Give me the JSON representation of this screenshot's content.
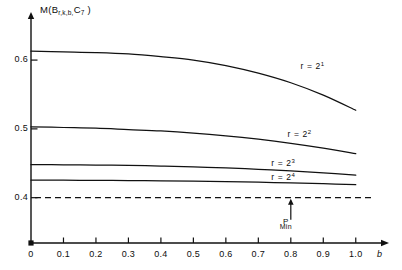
{
  "figure": {
    "y_axis_title": "M(B",
    "y_axis_title_sub1": "r,k,b,",
    "y_axis_title_sub2": "C",
    "y_axis_title_sub3": "7",
    "y_axis_title_close": " )",
    "x_axis_symbol": "b"
  },
  "annotations": {
    "pmin_main": "P",
    "pmin_sub": "Min"
  },
  "chart_data": {
    "type": "line",
    "xlabel": "b",
    "ylabel": "M(B_{r,k,b}, C_7)",
    "xlim": [
      0,
      1.05
    ],
    "ylim": [
      0.385,
      0.635
    ],
    "grid": false,
    "legend_position": "inline-right",
    "x_ticks": [
      "0",
      "0.1",
      "0.2",
      "0.3",
      "0.4",
      "0.5",
      "0.6",
      "0.7",
      "0.8",
      "0.9",
      "1.0"
    ],
    "x_tick_values": [
      0,
      0.1,
      0.2,
      0.3,
      0.4,
      0.5,
      0.6,
      0.7,
      0.8,
      0.9,
      1.0
    ],
    "y_ticks": [
      "0.4",
      "0.5",
      "0.6"
    ],
    "y_tick_values": [
      0.4,
      0.5,
      0.6
    ],
    "reference_lines": [
      {
        "name": "P_Min",
        "orientation": "horizontal",
        "value": 0.4,
        "style": "dashed"
      }
    ],
    "annotations": [
      {
        "text": "P Min",
        "x": 0.8,
        "y": 0.4,
        "arrow": "up"
      }
    ],
    "series": [
      {
        "name": "r = 2¹",
        "label": "r = 2",
        "exponent": "1",
        "x": [
          0.0,
          0.1,
          0.2,
          0.3,
          0.4,
          0.5,
          0.6,
          0.7,
          0.8,
          0.9,
          1.0
        ],
        "values": [
          0.613,
          0.612,
          0.611,
          0.609,
          0.605,
          0.6,
          0.592,
          0.581,
          0.567,
          0.549,
          0.527
        ]
      },
      {
        "name": "r = 2²",
        "label": "r = 2",
        "exponent": "2",
        "x": [
          0.0,
          0.1,
          0.2,
          0.3,
          0.4,
          0.5,
          0.6,
          0.7,
          0.8,
          0.9,
          1.0
        ],
        "values": [
          0.503,
          0.502,
          0.501,
          0.499,
          0.497,
          0.494,
          0.49,
          0.485,
          0.479,
          0.472,
          0.464
        ]
      },
      {
        "name": "r = 2³",
        "label": "r = 2",
        "exponent": "3",
        "x": [
          0.0,
          0.1,
          0.2,
          0.3,
          0.4,
          0.5,
          0.6,
          0.7,
          0.8,
          0.9,
          1.0
        ],
        "values": [
          0.448,
          0.4478,
          0.4474,
          0.4468,
          0.446,
          0.4448,
          0.4432,
          0.4412,
          0.4388,
          0.436,
          0.4328
        ]
      },
      {
        "name": "r = 2⁴",
        "label": "r = 2",
        "exponent": "4",
        "x": [
          0.0,
          0.1,
          0.2,
          0.3,
          0.4,
          0.5,
          0.6,
          0.7,
          0.8,
          0.9,
          1.0
        ],
        "values": [
          0.4255,
          0.4254,
          0.4252,
          0.4249,
          0.4245,
          0.424,
          0.4233,
          0.4225,
          0.4215,
          0.4203,
          0.419
        ]
      }
    ]
  },
  "colors": {
    "ink": "#111111",
    "background": "#ffffff"
  }
}
